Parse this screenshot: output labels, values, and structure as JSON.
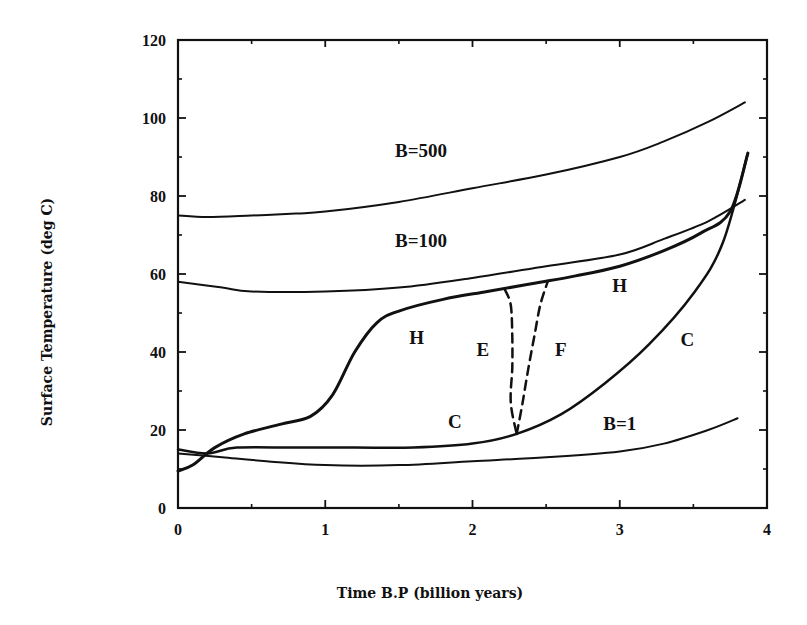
{
  "chart_data": {
    "type": "line",
    "title": "",
    "xlabel": "Time B.P (billion years)",
    "ylabel": "Surface Temperature (deg C)",
    "xlim": [
      0,
      4
    ],
    "ylim": [
      0,
      120
    ],
    "xticks": [
      0,
      1,
      2,
      3,
      4
    ],
    "yticks": [
      0,
      20,
      40,
      60,
      80,
      100,
      120
    ],
    "grid": false,
    "legend": "none (curves labelled inline)",
    "series": [
      {
        "name": "B=500",
        "style": "solid",
        "width": 2,
        "x": [
          0,
          0.2,
          0.5,
          0.8,
          1.0,
          1.5,
          2.0,
          2.5,
          3.0,
          3.3,
          3.6,
          3.85
        ],
        "y": [
          75,
          74.6,
          75,
          75.5,
          76,
          78.5,
          82,
          85.5,
          90,
          94,
          99,
          104
        ]
      },
      {
        "name": "B=100",
        "style": "solid",
        "width": 2,
        "x": [
          0,
          0.3,
          0.5,
          1.0,
          1.5,
          2.0,
          2.5,
          3.0,
          3.3,
          3.6,
          3.85
        ],
        "y": [
          58,
          56.5,
          55.5,
          55.5,
          56.5,
          59,
          62,
          65,
          69,
          73.5,
          79
        ]
      },
      {
        "name": "B=1",
        "style": "solid",
        "width": 2,
        "x": [
          0,
          0.3,
          0.6,
          1.0,
          1.5,
          2.0,
          2.5,
          3.0,
          3.3,
          3.6,
          3.8
        ],
        "y": [
          14,
          13,
          12,
          11,
          11,
          12,
          13,
          14.5,
          16.5,
          20,
          23
        ]
      },
      {
        "name": "H (hot branch)",
        "style": "solid",
        "width": 3,
        "x": [
          0,
          0.1,
          0.25,
          0.45,
          0.7,
          0.9,
          1.05,
          1.2,
          1.35,
          1.5,
          1.8,
          2.1,
          2.4,
          2.7,
          3.0,
          3.3,
          3.55,
          3.75,
          3.87
        ],
        "y": [
          9.5,
          11,
          15.5,
          19,
          21.5,
          23.5,
          29,
          40,
          47.5,
          50.5,
          53.5,
          55.5,
          57.5,
          59.5,
          62,
          66,
          70.5,
          76,
          91
        ]
      },
      {
        "name": "C (cold branch)",
        "style": "solid",
        "width": 2.5,
        "x": [
          0,
          0.2,
          0.4,
          0.8,
          1.2,
          1.6,
          2.0,
          2.3,
          2.6,
          2.9,
          3.2,
          3.5,
          3.7,
          3.87
        ],
        "y": [
          15,
          14,
          15.5,
          15.5,
          15.5,
          15.5,
          16.5,
          19,
          24,
          32,
          42,
          55,
          68,
          91
        ]
      },
      {
        "name": "E (transition)",
        "style": "dashed",
        "width": 2.5,
        "x": [
          2.22,
          2.26,
          2.27,
          2.27,
          2.26,
          2.3
        ],
        "y": [
          56,
          52,
          44,
          36,
          27,
          19
        ]
      },
      {
        "name": "F (transition)",
        "style": "dashed",
        "width": 2.5,
        "x": [
          2.3,
          2.34,
          2.38,
          2.42,
          2.46,
          2.51
        ],
        "y": [
          19,
          27,
          36,
          44,
          52,
          58
        ]
      }
    ],
    "annotations": [
      {
        "text": "B=500",
        "x": 1.65,
        "y": 90
      },
      {
        "text": "B=100",
        "x": 1.65,
        "y": 67
      },
      {
        "text": "H",
        "x": 1.62,
        "y": 42
      },
      {
        "text": "H",
        "x": 3.0,
        "y": 55.5
      },
      {
        "text": "E",
        "x": 2.07,
        "y": 39
      },
      {
        "text": "F",
        "x": 2.6,
        "y": 39
      },
      {
        "text": "C",
        "x": 1.88,
        "y": 20.5
      },
      {
        "text": "C",
        "x": 3.46,
        "y": 41.5
      },
      {
        "text": "B=1",
        "x": 3.0,
        "y": 20
      }
    ]
  },
  "axes": {
    "x_tick_labels": [
      "0",
      "1",
      "2",
      "3",
      "4"
    ],
    "y_tick_labels": [
      "0",
      "20",
      "40",
      "60",
      "80",
      "100",
      "120"
    ],
    "x_title": "Time B.P (billion years)",
    "y_title": "Surface Temperature (deg C)"
  }
}
